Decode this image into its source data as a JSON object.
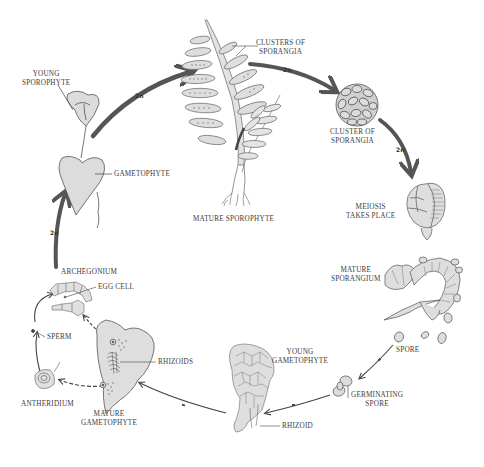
{
  "diagram": {
    "type": "life-cycle",
    "stages": [
      {
        "id": "mature-sporophyte",
        "label": "MATURE SPOROPHYTE",
        "ploidy": "2n"
      },
      {
        "id": "clusters-of-sporangia-leaf",
        "label": "CLUSTERS OF SPORANGIA",
        "ploidy": "2n"
      },
      {
        "id": "cluster-of-sporangia",
        "label": "CLUSTER OF SPORANGIA",
        "ploidy": "2n"
      },
      {
        "id": "meiosis",
        "label": "MEIOSIS TAKES PLACE"
      },
      {
        "id": "mature-sporangium",
        "label": "MATURE SPORANGIUM"
      },
      {
        "id": "spore",
        "label": "SPORE",
        "ploidy": "n"
      },
      {
        "id": "germinating-spore",
        "label": "GERMINATING SPORE",
        "ploidy": "n"
      },
      {
        "id": "young-gametophyte",
        "label": "YOUNG GAMETOPHYTE",
        "ploidy": "n"
      },
      {
        "id": "mature-gametophyte",
        "label": "MATURE GAMETOPHYTE",
        "ploidy": "n"
      },
      {
        "id": "antheridium",
        "label": "ANTHERIDIUM"
      },
      {
        "id": "sperm",
        "label": "SPERM"
      },
      {
        "id": "archegonium",
        "label": "ARCHEGONIUM"
      },
      {
        "id": "egg-cell",
        "label": "EGG CELL"
      },
      {
        "id": "gametophyte",
        "label": "GAMETOPHYTE"
      },
      {
        "id": "young-sporophyte",
        "label": "YOUNG SPOROPHYTE",
        "ploidy": "2n"
      }
    ]
  },
  "labels": {
    "young_sporophyte_1": "YOUNG",
    "young_sporophyte_2": "SPOROPHYTE",
    "gametophyte": "GAMETOPHYTE",
    "clusters_1": "CLUSTERS OF",
    "clusters_2": "SPORANGIA",
    "mature_sporophyte": "MATURE SPOROPHYTE",
    "cluster_1": "CLUSTER OF",
    "cluster_2": "SPORANGIA",
    "meiosis_1": "MEIOSIS",
    "meiosis_2": "TAKES PLACE",
    "mature_sporangium_1": "MATURE",
    "mature_sporangium_2": "SPORANGIUM",
    "spore": "SPORE",
    "germinating_1": "GERMINATING",
    "germinating_2": "SPORE",
    "young_gametophyte_1": "YOUNG",
    "young_gametophyte_2": "GAMETOPHYTE",
    "rhizoid": "RHIZOID",
    "rhizoids": "RHIZOIDS",
    "mature_gametophyte_1": "MATURE",
    "mature_gametophyte_2": "GAMETOPHYTE",
    "antheridium": "ANTHERIDIUM",
    "sperm": "SPERM",
    "archegonium": "ARCHEGONIUM",
    "egg_cell": "EGG CELL"
  },
  "ploidy_marks": {
    "arrow_to_sporophyte": "2n",
    "arrow_to_cluster": "2n",
    "arrow_to_meiosis": "2n",
    "arrow_up_left": "2n",
    "arrow_spore": "n",
    "arrow_germinating": "n",
    "arrow_to_mature_gametophyte": "n"
  },
  "colors": {
    "ink": "#3a3a3a",
    "fill": "#d9d9d9",
    "arrow": "#555555"
  }
}
